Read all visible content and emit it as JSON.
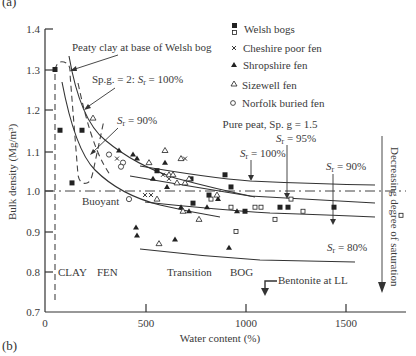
{
  "panel_labels": {
    "top": "(a)",
    "bottom": "(b)"
  },
  "chart_data": {
    "type": "scatter",
    "title": "",
    "xlabel": "Water content (%)",
    "ylabel": "Bulk density (Mg/m³)",
    "xlim": [
      0,
      1800
    ],
    "ylim": [
      0.7,
      1.4
    ],
    "xticks": [
      0,
      500,
      1000,
      1500
    ],
    "yticks": [
      0.7,
      0.8,
      0.9,
      1.0,
      1.1,
      1.2,
      1.3,
      1.4
    ],
    "legend_position": "upper right",
    "legend": [
      {
        "name": "Welsh bogs",
        "marker": "filled-square / open-square"
      },
      {
        "name": "Cheshire poor fen",
        "marker": "x"
      },
      {
        "name": "Shropshire fen",
        "marker": "filled-triangle"
      },
      {
        "name": "Sizewell fen",
        "marker": "open-triangle"
      },
      {
        "name": "Norfolk buried fen",
        "marker": "open-circle"
      }
    ],
    "series": [
      {
        "name": "Welsh bogs (filled)",
        "points": [
          [
            50,
            1.3
          ],
          [
            75,
            1.15
          ],
          [
            135,
            1.02
          ],
          [
            185,
            1.15
          ],
          [
            560,
            1.05
          ],
          [
            740,
            0.97
          ],
          [
            820,
            0.99
          ],
          [
            900,
            1.04
          ],
          [
            930,
            1.01
          ],
          [
            1000,
            0.95
          ],
          [
            1175,
            0.96
          ],
          [
            1215,
            0.96
          ],
          [
            1445,
            0.96
          ],
          [
            730,
            1.03
          ]
        ]
      },
      {
        "name": "Welsh bogs (open)",
        "points": [
          [
            830,
            0.98
          ],
          [
            930,
            0.96
          ],
          [
            1050,
            0.96
          ],
          [
            1080,
            0.96
          ],
          [
            1150,
            0.93
          ],
          [
            1230,
            0.98
          ],
          [
            1290,
            0.95
          ],
          [
            955,
            0.9
          ],
          [
            1780,
            0.94
          ]
        ]
      },
      {
        "name": "Cheshire poor fen",
        "points": [
          [
            360,
            1.08
          ],
          [
            700,
            1.08
          ],
          [
            590,
            1.04
          ],
          [
            500,
            0.99
          ],
          [
            530,
            0.99
          ],
          [
            620,
            1.03
          ]
        ]
      },
      {
        "name": "Shropshire fen",
        "points": [
          [
            370,
            1.1
          ],
          [
            440,
            1.09
          ],
          [
            460,
            1.08
          ],
          [
            540,
            1.03
          ],
          [
            600,
            1.07
          ],
          [
            610,
            1.01
          ],
          [
            680,
            0.96
          ],
          [
            720,
            0.95
          ],
          [
            810,
            0.96
          ],
          [
            865,
            0.98
          ],
          [
            960,
            0.95
          ],
          [
            455,
            0.91
          ],
          [
            460,
            0.89
          ],
          [
            650,
            0.88
          ],
          [
            920,
            0.86
          ]
        ]
      },
      {
        "name": "Sizewell fen",
        "points": [
          [
            600,
            1.1
          ],
          [
            680,
            1.08
          ],
          [
            520,
            1.07
          ],
          [
            620,
            1.04
          ],
          [
            640,
            1.04
          ],
          [
            660,
            1.02
          ],
          [
            700,
            1.02
          ],
          [
            720,
            1.03
          ],
          [
            560,
            0.98
          ],
          [
            690,
            0.95
          ],
          [
            860,
            0.99
          ],
          [
            570,
            0.87
          ],
          [
            770,
            0.93
          ],
          [
            240,
            1.18
          ]
        ]
      },
      {
        "name": "Norfolk buried fen",
        "points": [
          [
            320,
            1.09
          ],
          [
            390,
            1.07
          ],
          [
            380,
            1.06
          ],
          [
            420,
            0.98
          ]
        ]
      }
    ],
    "annotations": [
      "Peaty clay at base of Welsh bog",
      "Sp.g. = 2: Sr = 100%",
      "Sr = 90%",
      "Buoyant",
      "Pure peat, Sp. g = 1.5",
      "Sr = 95%",
      "Sr = 100%",
      "Sr = 90%",
      "Sr = 80%",
      "Decreasing degree of saturation",
      "Bentonite at LL",
      "CLAY",
      "FEN",
      "Transition",
      "BOG"
    ],
    "reference_lines": [
      {
        "name": "Buoyant",
        "y": 1.0,
        "style": "dash-dot"
      }
    ]
  },
  "labels": {
    "peaty_clay": "Peaty clay at base of Welsh bog",
    "spg2": "Sp.g. = 2: ",
    "spg2_sr": "S",
    "spg2_val": " = 100%",
    "sr90_left": " = 90%",
    "buoyant": "Buoyant",
    "pure_peat": "Pure peat, Sp. g = 1.5",
    "sr95": " = 95%",
    "sr100": " = 100%",
    "sr90_right": " = 90%",
    "sr80": " = 80%",
    "decreasing": "Decreasing degree of saturation",
    "bentonite": "Bentonite at LL",
    "clay": "CLAY",
    "fen": "FEN",
    "transition": "Transition",
    "bog": "BOG",
    "s": "S",
    "r": "r"
  },
  "legend_labels": [
    "Welsh bogs",
    "Cheshire poor fen",
    "Shropshire fen",
    "Sizewell fen",
    "Norfolk buried fen"
  ],
  "axis": {
    "xlabel": "Water content (%)",
    "ylabel": "Bulk density (Mg/m³)",
    "xtick_labels": [
      "0",
      "500",
      "1000",
      "1500"
    ],
    "ytick_labels": [
      "1.4",
      "1.3",
      "1.2",
      "1.1",
      "1.0",
      "0.9",
      "0.8",
      "0.7"
    ]
  }
}
